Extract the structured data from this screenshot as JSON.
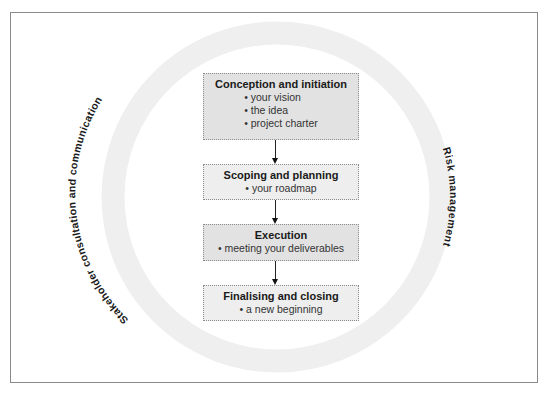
{
  "diagram": {
    "ring_color": "#efefef",
    "ring_labels": {
      "left": "Stakeholder consultation and communication",
      "right": "Risk management"
    },
    "stages": [
      {
        "title": "Conception and initiation",
        "items": [
          "• your vision",
          "• the idea",
          "• project charter"
        ],
        "shade": "dark"
      },
      {
        "title": "Scoping and planning",
        "items": [
          "• your roadmap"
        ],
        "shade": "light"
      },
      {
        "title": "Execution",
        "items": [
          "• meeting your deliverables"
        ],
        "shade": "dark"
      },
      {
        "title": "Finalising and closing",
        "items": [
          "• a new beginning"
        ],
        "shade": "light"
      }
    ]
  }
}
